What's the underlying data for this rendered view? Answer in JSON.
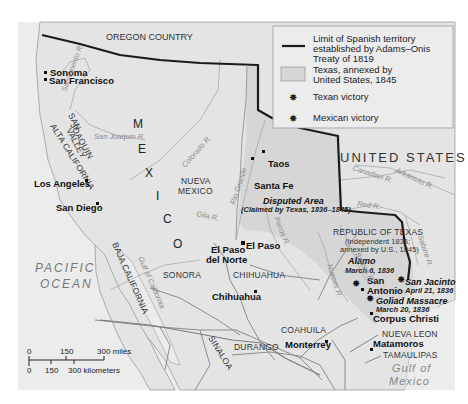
{
  "map": {
    "title": "Spanish borderlands, Texas annexation, and Texas Revolution battles",
    "colors": {
      "land_mexico": "#e6e6e6",
      "land_texas": "#dcdcdc",
      "ocean": "#ededed",
      "background": "#ffffff",
      "border_treaty": "#1a1a1a",
      "border_internal": "#8c8c8c",
      "river": "#a0a0a0"
    },
    "legend": {
      "items": [
        {
          "symbol": "thick-line",
          "label_lines": [
            "Limit of Spanish territory",
            "established by Adams–Onis",
            "Treaty of 1819"
          ]
        },
        {
          "symbol": "shaded-box",
          "label_lines": [
            "Texas, annexed by",
            "United States, 1845"
          ]
        },
        {
          "symbol": "star-burst",
          "label_lines": [
            "Texan victory"
          ]
        },
        {
          "symbol": "star-burst",
          "label_lines": [
            "Mexican victory"
          ]
        }
      ]
    },
    "countries": {
      "oregon": "OREGON COUNTRY",
      "united_states": "UNITED STATES",
      "mexico_letters": [
        "M",
        "E",
        "X",
        "I",
        "C",
        "O"
      ]
    },
    "regions": {
      "alta_california": "ALTA CALIFORNIA",
      "san_joaquin_valley_1": "SAN",
      "san_joaquin_valley_2": "JOAQUIN",
      "san_joaquin_valley_3": "VALLEY",
      "nueva_mexico_1": "NUEVA",
      "nueva_mexico_2": "MEXICO",
      "sonora": "SONORA",
      "chihuahua": "CHIHUAHUA",
      "baja_california": "BAJA CALIFORNIA",
      "sinaloa": "SINALOA",
      "durango": "DURANGO",
      "coahuila": "COAHUILA",
      "nueva_leon": "NUEVA LEON",
      "tamaulipas": "TAMAULIPAS",
      "republic_of_texas": "REPUBLIC OF TEXAS",
      "republic_note_1": "(Independent 1836;",
      "republic_note_2": "annexed by U.S., 1845)",
      "disputed_area": "Disputed Area",
      "disputed_note": "(Claimed by Texas, 1836–1845)"
    },
    "cities": [
      {
        "name": "Sonoma"
      },
      {
        "name": "San Francisco"
      },
      {
        "name": "Los Angeles"
      },
      {
        "name": "San Diego"
      },
      {
        "name": "Taos"
      },
      {
        "name": "Santa Fe"
      },
      {
        "name": "El Paso"
      },
      {
        "name": "El Paso del Norte"
      },
      {
        "name": "Chihuahua"
      },
      {
        "name": "Monterrey"
      },
      {
        "name": "San Antonio"
      },
      {
        "name": "Corpus Christi"
      },
      {
        "name": "Matamoros"
      }
    ],
    "city_labels": {
      "sonoma": "Sonoma",
      "san_francisco": "San Francisco",
      "los_angeles": "Los Angeles",
      "san_diego": "San Diego",
      "taos": "Taos",
      "santa_fe": "Santa Fe",
      "el_paso": "El Paso",
      "el_paso_del_norte_1": "El Paso",
      "el_paso_del_norte_2": "del Norte",
      "chihuahua": "Chihuahua",
      "monterrey": "Monterrey",
      "san_antonio_1": "San",
      "san_antonio_2": "Antonio",
      "corpus_christi": "Corpus Christi",
      "matamoros": "Matamoros"
    },
    "battles": {
      "alamo": {
        "name": "Alamo",
        "date": "March 6, 1836",
        "outcome": "Mexican victory"
      },
      "san_jacinto": {
        "name": "San Jacinto",
        "date": "April 21, 1836",
        "outcome": "Texan victory"
      },
      "goliad": {
        "name": "Goliad Massacre",
        "date": "March 20, 1836",
        "outcome": "Mexican victory"
      }
    },
    "rivers": {
      "sacramento": "Sacramento R.",
      "san_joaquin": "San Joaquin R.",
      "colorado": "Colorado R.",
      "gila": "Gila R.",
      "rio_grande": "Rio Grande",
      "pecos": "Pecos R.",
      "nueces": "Nueces R.",
      "brazos": "Brazos R.",
      "red": "Red R.",
      "canadian": "Canadian R.",
      "arkansas": "Arkansas R.",
      "sabine": "Sabine R."
    },
    "water": {
      "pacific_1": "PACIFIC",
      "pacific_2": "OCEAN",
      "gulf_of_california": "Gulf of California",
      "gulf_of_mexico_1": "Gulf of",
      "gulf_of_mexico_2": "Mexico"
    },
    "scale": {
      "miles_ticks": [
        "0",
        "150",
        "300 miles"
      ],
      "km_ticks": [
        "0",
        "150",
        "300 kilometers"
      ]
    }
  }
}
